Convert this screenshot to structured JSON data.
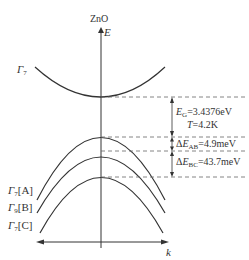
{
  "title": "ZnO",
  "axes": {
    "y_label": "E",
    "x_label": "k"
  },
  "bands": {
    "conduction": {
      "label": "Γ",
      "sub": "7"
    },
    "valence": [
      {
        "label": "Γ",
        "sub": "7",
        "tag": "[A]"
      },
      {
        "label": "Γ",
        "sub": "9",
        "tag": "[B]"
      },
      {
        "label": "Γ",
        "sub": "7",
        "tag": "[C]"
      }
    ]
  },
  "annotations": {
    "gap": {
      "symbol": "E",
      "sub": "G",
      "value": "=3.4376eV"
    },
    "temperature": {
      "symbol": "T",
      "value": "=4.2K"
    },
    "delta_ab": {
      "prefix": "Δ",
      "symbol": "E",
      "sub": "AB",
      "value": "=4.9meV"
    },
    "delta_bc": {
      "prefix": "Δ",
      "symbol": "E",
      "sub": "BC",
      "value": "=43.7meV"
    }
  },
  "colors": {
    "line": "#333333",
    "dash": "#666666"
  }
}
